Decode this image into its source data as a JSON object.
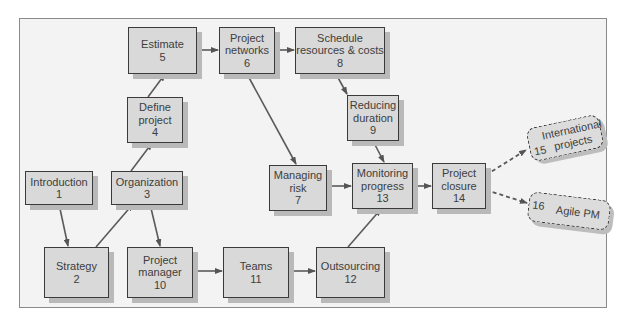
{
  "diagram": {
    "type": "flowchart",
    "title": "",
    "nodes": [
      {
        "id": 1,
        "label": "Introduction",
        "number": "1"
      },
      {
        "id": 2,
        "label": "Strategy",
        "number": "2"
      },
      {
        "id": 3,
        "label": "Organization",
        "number": "3"
      },
      {
        "id": 4,
        "label_line1": "Define",
        "label_line2": "project",
        "number": "4"
      },
      {
        "id": 5,
        "label": "Estimate",
        "number": "5"
      },
      {
        "id": 6,
        "label_line1": "Project",
        "label_line2": "networks",
        "number": "6"
      },
      {
        "id": 7,
        "label_line1": "Managing",
        "label_line2": "risk",
        "number": "7"
      },
      {
        "id": 8,
        "label_line1": "Schedule",
        "label_line2": "resources & costs",
        "number": "8"
      },
      {
        "id": 9,
        "label_line1": "Reducing",
        "label_line2": "duration",
        "number": "9"
      },
      {
        "id": 10,
        "label_line1": "Project",
        "label_line2": "manager",
        "number": "10"
      },
      {
        "id": 11,
        "label": "Teams",
        "number": "11"
      },
      {
        "id": 12,
        "label": "Outsourcing",
        "number": "12"
      },
      {
        "id": 13,
        "label_line1": "Monitoring",
        "label_line2": "progress",
        "number": "13"
      },
      {
        "id": 14,
        "label_line1": "Project",
        "label_line2": "closure",
        "number": "14"
      },
      {
        "id": 15,
        "label_line1": "International",
        "label_line2": "projects",
        "number": "15",
        "style": "dashed"
      },
      {
        "id": 16,
        "label": "Agile PM",
        "number": "16",
        "style": "dashed"
      }
    ],
    "edges": [
      {
        "from": 1,
        "to": 2,
        "style": "solid"
      },
      {
        "from": 2,
        "to": 3,
        "style": "solid"
      },
      {
        "from": 3,
        "to": 4,
        "style": "solid"
      },
      {
        "from": 3,
        "to": 10,
        "style": "solid"
      },
      {
        "from": 4,
        "to": 5,
        "style": "solid"
      },
      {
        "from": 5,
        "to": 6,
        "style": "solid"
      },
      {
        "from": 6,
        "to": 8,
        "style": "solid"
      },
      {
        "from": 6,
        "to": 7,
        "style": "solid"
      },
      {
        "from": 8,
        "to": 9,
        "style": "solid"
      },
      {
        "from": 9,
        "to": 13,
        "style": "solid"
      },
      {
        "from": 7,
        "to": 13,
        "style": "solid"
      },
      {
        "from": 10,
        "to": 11,
        "style": "solid"
      },
      {
        "from": 11,
        "to": 12,
        "style": "solid"
      },
      {
        "from": 12,
        "to": 13,
        "style": "solid"
      },
      {
        "from": 13,
        "to": 14,
        "style": "solid"
      },
      {
        "from": 14,
        "to": 15,
        "style": "dashed"
      },
      {
        "from": 14,
        "to": 16,
        "style": "dashed"
      }
    ],
    "colors": {
      "node_fill": "#d9d9d9",
      "node_border": "#3a3a3a",
      "node_shadow": "#b9b9b9",
      "arrow": "#555555",
      "frame_bg": "#f3f3f3",
      "frame_border": "#8a8a8a",
      "text": "#3d3d3d"
    }
  }
}
